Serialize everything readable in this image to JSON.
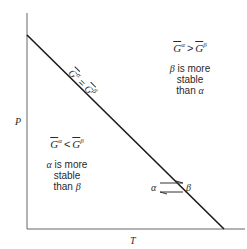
{
  "diagram": {
    "type": "phase-boundary",
    "axes": {
      "y_label": "P",
      "x_label": "T"
    },
    "boundary_line": {
      "label_lhs_symbol": "G",
      "label_lhs_sup": "α",
      "label_op": "=",
      "label_rhs_symbol": "G",
      "label_rhs_sup": "β"
    },
    "region_upper_right": {
      "eq_lhs_symbol": "G",
      "eq_lhs_sup": "α",
      "eq_op": ">",
      "eq_rhs_symbol": "G",
      "eq_rhs_sup": "β",
      "line1_greek": "β",
      "line1_rest": " is more",
      "line2": "stable",
      "line3_rest": "than ",
      "line3_greek": "α"
    },
    "region_lower_left": {
      "eq_lhs_symbol": "G",
      "eq_lhs_sup": "α",
      "eq_op": "<",
      "eq_rhs_symbol": "G",
      "eq_rhs_sup": "β",
      "line1_greek": "α",
      "line1_rest": " is more",
      "line2": "stable",
      "line3_rest": "than ",
      "line3_greek": "β"
    },
    "equilibrium": {
      "left": "α",
      "right": "β"
    },
    "colors": {
      "line": "#1a1a1a",
      "axis": "#555555",
      "text": "#2a2a2a"
    }
  }
}
